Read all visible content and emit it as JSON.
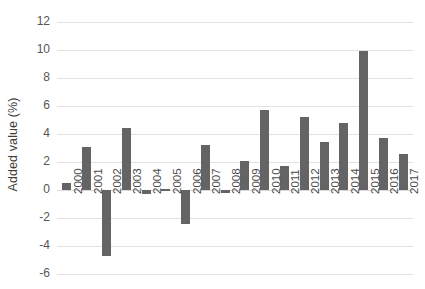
{
  "chart_data": {
    "type": "bar",
    "title": "",
    "xlabel": "",
    "ylabel": "Added value (%)",
    "ylim": [
      -6,
      12
    ],
    "ytick_step": 2,
    "yticks": [
      "12",
      "10",
      "8",
      "6",
      "4",
      "2",
      "0",
      "-2",
      "-4",
      "-6"
    ],
    "grid": true,
    "legend": "none",
    "bar_color": "#646464",
    "gridline_color": "#e2e2e2",
    "categories": [
      "2000",
      "2001",
      "2002",
      "2003",
      "2004",
      "2005",
      "2006",
      "2007",
      "2008",
      "2009",
      "2010",
      "2011",
      "2012",
      "2013",
      "2014",
      "2015",
      "2016",
      "2017"
    ],
    "values": [
      0.5,
      3.1,
      -4.7,
      4.4,
      -0.3,
      0.05,
      -2.4,
      3.2,
      -0.2,
      2.1,
      5.7,
      1.7,
      5.2,
      3.4,
      4.8,
      9.9,
      3.7,
      2.6
    ]
  }
}
